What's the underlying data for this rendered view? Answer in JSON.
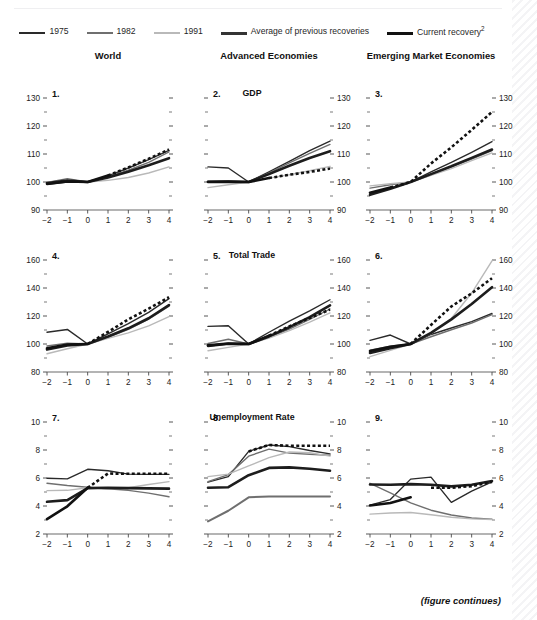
{
  "figure": {
    "top_cut_text": "",
    "footer_note": "(figure continues)",
    "columns": [
      {
        "key": "world",
        "label": "World"
      },
      {
        "key": "advanced",
        "label": "Advanced Economies"
      },
      {
        "key": "emerging",
        "label": "Emerging Market Economies"
      }
    ],
    "row_titles": [
      "GDP",
      "Total Trade",
      "Unemployment Rate"
    ],
    "legend": [
      {
        "key": "y1975",
        "label": "1975",
        "color": "#2a2a2a",
        "width": 1.6,
        "dash": "none"
      },
      {
        "key": "y1982",
        "label": "1982",
        "color": "#6f6f6f",
        "width": 1.6,
        "dash": "none"
      },
      {
        "key": "y1991",
        "label": "1991",
        "color": "#b9b9b9",
        "width": 1.6,
        "dash": "none"
      },
      {
        "key": "average",
        "label": "Average of previous recoveries",
        "color": "#343434",
        "width": 2.9,
        "dash": "none"
      },
      {
        "key": "current",
        "label": "Current recovery",
        "label_sup": "2",
        "color": "#111111",
        "width": 2.9,
        "dash": "none"
      }
    ],
    "panel_numbers": [
      "1.",
      "2.",
      "3.",
      "4.",
      "5.",
      "6.",
      "7.",
      "8.",
      "9."
    ]
  },
  "chart_data": [
    {
      "id": "panel-1",
      "number": "1.",
      "type": "line",
      "title": "GDP",
      "column": "World",
      "xlabel": "",
      "ylabel": "",
      "x": [
        -2,
        -1,
        0,
        1,
        2,
        3,
        4
      ],
      "xtick_labels": [
        "−2",
        "−1",
        "0",
        "1",
        "2",
        "3",
        "4"
      ],
      "ylim": [
        90,
        130
      ],
      "yticks": [
        90,
        100,
        110,
        120,
        130
      ],
      "grid": false,
      "legend_position": "top",
      "series": [
        {
          "name": "1975",
          "values": [
            99.2,
            100.0,
            100.0,
            102.2,
            105.0,
            108.0,
            111.3
          ],
          "color": "#2a2a2a",
          "width": 1.4
        },
        {
          "name": "1982",
          "values": [
            99.8,
            101.2,
            100.0,
            101.8,
            104.2,
            107.0,
            110.8
          ],
          "color": "#6f6f6f",
          "width": 1.4
        },
        {
          "name": "1991",
          "values": [
            100.0,
            100.4,
            100.0,
            100.6,
            101.6,
            103.2,
            105.4
          ],
          "color": "#b9b9b9",
          "width": 1.4
        },
        {
          "name": "Average of previous recoveries",
          "values": [
            99.6,
            100.5,
            100.0,
            101.6,
            103.7,
            106.0,
            108.5
          ],
          "color": "#1d1d1d",
          "width": 2.6
        },
        {
          "name": "Current recovery",
          "values": [
            99.3,
            100.2,
            100.0,
            102.3,
            105.2,
            108.3,
            111.6
          ],
          "color": "#111111",
          "width": 2.6,
          "dash_from_index": 4,
          "dash": "3 2.4"
        }
      ]
    },
    {
      "id": "panel-2",
      "number": "2.",
      "type": "line",
      "title": "GDP",
      "column": "Advanced Economies",
      "x": [
        -2,
        -1,
        0,
        1,
        2,
        3,
        4
      ],
      "xtick_labels": [
        "−2",
        "−1",
        "0",
        "1",
        "2",
        "3",
        "4"
      ],
      "ylim": [
        90,
        130
      ],
      "yticks": [
        90,
        100,
        110,
        120,
        130
      ],
      "grid": false,
      "series": [
        {
          "name": "1975",
          "values": [
            105.4,
            105.0,
            100.0,
            103.6,
            107.4,
            111.2,
            114.6
          ],
          "color": "#2a2a2a",
          "width": 1.4
        },
        {
          "name": "1982",
          "values": [
            100.2,
            100.3,
            100.0,
            103.2,
            106.8,
            110.2,
            113.4
          ],
          "color": "#6f6f6f",
          "width": 1.4
        },
        {
          "name": "1991",
          "values": [
            98.0,
            99.0,
            100.0,
            101.4,
            102.6,
            104.0,
            105.6
          ],
          "color": "#b9b9b9",
          "width": 1.4
        },
        {
          "name": "Average of previous recoveries",
          "values": [
            100.1,
            100.2,
            100.0,
            102.8,
            105.8,
            108.6,
            111.0
          ],
          "color": "#1d1d1d",
          "width": 2.6
        },
        {
          "name": "Current recovery",
          "values": [
            100.0,
            100.1,
            100.0,
            101.4,
            102.6,
            103.6,
            104.8
          ],
          "color": "#111111",
          "width": 2.6,
          "dash_from_index": 4,
          "dash": "3 2.4"
        }
      ]
    },
    {
      "id": "panel-3",
      "number": "3.",
      "type": "line",
      "title": "GDP",
      "column": "Emerging Market Economies",
      "x": [
        -2,
        -1,
        0,
        1,
        2,
        3,
        4
      ],
      "xtick_labels": [
        "−2",
        "−1",
        "0",
        "1",
        "2",
        "3",
        "4"
      ],
      "ylim": [
        90,
        130
      ],
      "yticks": [
        90,
        100,
        110,
        120,
        130
      ],
      "grid": false,
      "series": [
        {
          "name": "1975",
          "values": [
            95.6,
            97.8,
            100.0,
            103.6,
            107.0,
            110.6,
            114.4
          ],
          "color": "#2a2a2a",
          "width": 1.4
        },
        {
          "name": "1982",
          "values": [
            97.8,
            99.0,
            100.0,
            102.6,
            105.4,
            108.2,
            111.2
          ],
          "color": "#6f6f6f",
          "width": 1.4
        },
        {
          "name": "1991",
          "values": [
            98.6,
            99.4,
            100.0,
            102.4,
            104.8,
            107.6,
            110.4
          ],
          "color": "#b9b9b9",
          "width": 1.4
        },
        {
          "name": "Average of previous recoveries",
          "values": [
            95.4,
            97.6,
            100.0,
            102.8,
            105.6,
            108.6,
            111.6
          ],
          "color": "#1d1d1d",
          "width": 2.6
        },
        {
          "name": "Current recovery",
          "values": [
            96.2,
            98.0,
            100.0,
            106.6,
            112.4,
            118.6,
            125.0
          ],
          "color": "#111111",
          "width": 2.6,
          "dash_from_index": 2,
          "dash": "3 2.4"
        }
      ]
    },
    {
      "id": "panel-4",
      "number": "4.",
      "type": "line",
      "title": "Total Trade",
      "column": "World",
      "x": [
        -2,
        -1,
        0,
        1,
        2,
        3,
        4
      ],
      "xtick_labels": [
        "−2",
        "−1",
        "0",
        "1",
        "2",
        "3",
        "4"
      ],
      "ylim": [
        80,
        160
      ],
      "yticks": [
        80,
        100,
        120,
        140,
        160
      ],
      "grid": false,
      "series": [
        {
          "name": "1975",
          "values": [
            108.4,
            110.4,
            100.0,
            107.2,
            114.6,
            122.6,
            132.4
          ],
          "color": "#2a2a2a",
          "width": 1.4
        },
        {
          "name": "1982",
          "values": [
            98.6,
            100.6,
            100.0,
            104.8,
            110.4,
            117.8,
            127.0
          ],
          "color": "#6f6f6f",
          "width": 1.4
        },
        {
          "name": "1991",
          "values": [
            93.0,
            96.6,
            100.0,
            104.0,
            108.0,
            113.0,
            119.6
          ],
          "color": "#b9b9b9",
          "width": 1.4
        },
        {
          "name": "Average of previous recoveries",
          "values": [
            96.0,
            99.0,
            100.0,
            105.4,
            111.2,
            118.4,
            127.8
          ],
          "color": "#1d1d1d",
          "width": 2.6
        },
        {
          "name": "Current recovery",
          "values": [
            97.0,
            99.6,
            100.0,
            108.6,
            117.6,
            125.2,
            133.4
          ],
          "color": "#111111",
          "width": 2.6,
          "dash_from_index": 3,
          "dash": "3 2.4"
        }
      ]
    },
    {
      "id": "panel-5",
      "number": "5.",
      "type": "line",
      "title": "Total Trade",
      "column": "Advanced Economies",
      "x": [
        -2,
        -1,
        0,
        1,
        2,
        3,
        4
      ],
      "xtick_labels": [
        "−2",
        "−1",
        "0",
        "1",
        "2",
        "3",
        "4"
      ],
      "ylim": [
        80,
        160
      ],
      "yticks": [
        80,
        100,
        120,
        140,
        160
      ],
      "grid": false,
      "series": [
        {
          "name": "1975",
          "values": [
            112.6,
            113.0,
            100.0,
            108.4,
            116.4,
            123.6,
            131.6
          ],
          "color": "#2a2a2a",
          "width": 1.4
        },
        {
          "name": "1982",
          "values": [
            100.4,
            103.4,
            100.0,
            104.8,
            110.6,
            117.6,
            125.0
          ],
          "color": "#6f6f6f",
          "width": 1.4
        },
        {
          "name": "1991",
          "values": [
            95.2,
            97.6,
            100.0,
            104.2,
            109.6,
            115.6,
            122.2
          ],
          "color": "#b9b9b9",
          "width": 1.4
        },
        {
          "name": "Average of previous recoveries",
          "values": [
            98.6,
            100.2,
            100.0,
            105.4,
            112.0,
            119.2,
            127.6
          ],
          "color": "#1d1d1d",
          "width": 2.6
        },
        {
          "name": "Current recovery",
          "values": [
            99.0,
            100.4,
            100.0,
            106.0,
            112.6,
            118.6,
            124.6
          ],
          "color": "#111111",
          "width": 2.6,
          "dash_from_index": 4,
          "dash": "3 2.4"
        }
      ]
    },
    {
      "id": "panel-6",
      "number": "6.",
      "type": "line",
      "title": "Total Trade",
      "column": "Emerging Market Economies",
      "x": [
        -2,
        -1,
        0,
        1,
        2,
        3,
        4
      ],
      "xtick_labels": [
        "−2",
        "−1",
        "0",
        "1",
        "2",
        "3",
        "4"
      ],
      "ylim": [
        80,
        160
      ],
      "yticks": [
        80,
        100,
        120,
        140,
        160
      ],
      "grid": false,
      "series": [
        {
          "name": "1975",
          "values": [
            102.6,
            106.4,
            100.0,
            106.8,
            111.4,
            116.0,
            121.8
          ],
          "color": "#2a2a2a",
          "width": 1.4
        },
        {
          "name": "1982",
          "values": [
            95.6,
            98.4,
            100.0,
            105.2,
            110.2,
            115.0,
            121.0
          ],
          "color": "#6f6f6f",
          "width": 1.4
        },
        {
          "name": "1991",
          "values": [
            91.0,
            95.4,
            100.0,
            107.4,
            118.2,
            136.4,
            159.4
          ],
          "color": "#b9b9b9",
          "width": 1.4
        },
        {
          "name": "Average of previous recoveries",
          "values": [
            93.6,
            97.0,
            100.0,
            108.0,
            117.6,
            128.6,
            140.6
          ],
          "color": "#1d1d1d",
          "width": 2.6
        },
        {
          "name": "Current recovery",
          "values": [
            95.0,
            98.0,
            100.0,
            113.6,
            126.8,
            136.2,
            147.0
          ],
          "color": "#111111",
          "width": 2.6,
          "dash_from_index": 3,
          "dash": "3 2.4"
        }
      ]
    },
    {
      "id": "panel-7",
      "number": "7.",
      "type": "line",
      "title": "Unemployment Rate",
      "column": "World",
      "x": [
        -2,
        -1,
        0,
        1,
        2,
        3,
        4
      ],
      "xtick_labels": [
        "−2",
        "−1",
        "0",
        "1",
        "2",
        "3",
        "4"
      ],
      "ylim": [
        2,
        10
      ],
      "yticks": [
        2,
        4,
        6,
        8,
        10
      ],
      "grid": false,
      "series": [
        {
          "name": "1975",
          "values": [
            5.98,
            5.94,
            6.62,
            6.52,
            6.28,
            6.26,
            6.26
          ],
          "color": "#2a2a2a",
          "width": 1.4
        },
        {
          "name": "1982",
          "values": [
            5.62,
            5.46,
            5.34,
            5.22,
            5.12,
            4.92,
            4.66
          ],
          "color": "#6f6f6f",
          "width": 1.4
        },
        {
          "name": "1991",
          "values": [
            5.1,
            5.12,
            5.3,
            5.22,
            5.3,
            5.54,
            5.74
          ],
          "color": "#b9b9b9",
          "width": 1.4
        },
        {
          "name": "Average of previous recoveries",
          "values": [
            4.3,
            4.42,
            5.28,
            5.3,
            5.28,
            5.26,
            5.24
          ],
          "color": "#1d1d1d",
          "width": 2.6
        },
        {
          "name": "Current recovery",
          "values": [
            3.06,
            3.98,
            5.3,
            6.32,
            6.3,
            6.3,
            6.3
          ],
          "color": "#111111",
          "width": 2.6,
          "dash_from_index": 3,
          "dash": "3 2.4"
        }
      ]
    },
    {
      "id": "panel-8",
      "number": "8.",
      "type": "line",
      "title": "Unemployment Rate",
      "column": "Advanced Economies",
      "x": [
        -2,
        -1,
        0,
        1,
        2,
        3,
        4
      ],
      "xtick_labels": [
        "−2",
        "−1",
        "0",
        "1",
        "2",
        "3",
        "4"
      ],
      "ylim": [
        2,
        10
      ],
      "yticks": [
        2,
        4,
        6,
        8,
        10
      ],
      "grid": false,
      "series": [
        {
          "name": "1975",
          "values": [
            5.7,
            6.1,
            7.9,
            8.36,
            8.24,
            7.96,
            7.72
          ],
          "color": "#2a2a2a",
          "width": 1.4
        },
        {
          "name": "1982",
          "values": [
            5.74,
            6.24,
            7.56,
            8.06,
            7.78,
            7.7,
            7.62
          ],
          "color": "#6f6f6f",
          "width": 1.4
        },
        {
          "name": "1991",
          "values": [
            6.1,
            6.28,
            6.86,
            7.46,
            7.86,
            7.8,
            7.56
          ],
          "color": "#b9b9b9",
          "width": 1.4
        },
        {
          "name": "Average of previous recoveries",
          "values": [
            5.3,
            5.34,
            6.2,
            6.72,
            6.76,
            6.66,
            6.52
          ],
          "color": "#1d1d1d",
          "width": 2.6
        },
        {
          "name": "Current recovery",
          "values": [
            2.9,
            3.66,
            4.62,
            4.68,
            4.68,
            4.68,
            4.68
          ],
          "color": "#6f6f6f",
          "width": 2.0
        },
        {
          "name": "Current recovery dashed",
          "values": [
            5.7,
            6.1,
            7.9,
            8.36,
            8.3,
            8.3,
            8.3
          ],
          "color": "#111111",
          "width": 2.6,
          "dash_from_index": 3,
          "dash": "3 2.4",
          "hidden_before_dash": true
        }
      ]
    },
    {
      "id": "panel-9",
      "number": "9.",
      "type": "line",
      "title": "Unemployment Rate",
      "column": "Emerging Market Economies",
      "x": [
        -2,
        -1,
        0,
        1,
        2,
        3,
        4
      ],
      "xtick_labels": [
        "−2",
        "−1",
        "0",
        "1",
        "2",
        "3",
        "4"
      ],
      "ylim": [
        2,
        10
      ],
      "yticks": [
        2,
        4,
        6,
        8,
        10
      ],
      "grid": false,
      "series": [
        {
          "name": "1975",
          "values": [
            4.06,
            4.46,
            5.92,
            6.06,
            4.26,
            5.06,
            5.72
          ],
          "color": "#2a2a2a",
          "width": 1.4
        },
        {
          "name": "1982",
          "values": [
            5.62,
            4.94,
            4.22,
            3.7,
            3.36,
            3.14,
            3.06
          ],
          "color": "#6f6f6f",
          "width": 1.4
        },
        {
          "name": "1991",
          "values": [
            3.42,
            3.5,
            3.54,
            3.38,
            3.2,
            3.08,
            3.04
          ],
          "color": "#b9b9b9",
          "width": 1.4
        },
        {
          "name": "Average of previous recoveries",
          "values": [
            5.54,
            5.52,
            5.56,
            5.52,
            5.4,
            5.52,
            5.78
          ],
          "color": "#1d1d1d",
          "width": 2.6
        },
        {
          "name": "Current recovery",
          "values": [
            4.04,
            4.22,
            4.62,
            4.54,
            4.04,
            4.36,
            4.84
          ],
          "color": "#111111",
          "width": 2.6,
          "dash_from_index": 3,
          "dash": "3 2.4",
          "dash_values": [
            5.3,
            5.3,
            5.42,
            5.72
          ]
        }
      ]
    }
  ]
}
